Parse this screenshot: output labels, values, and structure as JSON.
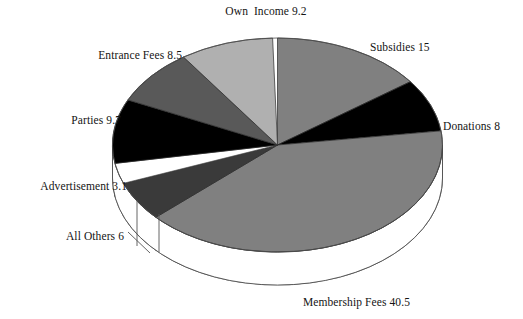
{
  "chart_data": {
    "type": "pie",
    "title": "",
    "subtitle": "",
    "xlabel": "",
    "ylabel": "",
    "legend_position": "none",
    "grid": false,
    "style": "3d-pie",
    "total": 100.5,
    "units": "percent",
    "categories": [
      "Subsidies",
      "Donations",
      "Membership Fees",
      "All Others",
      "Advertisement",
      "Parties",
      "Entrance Fees",
      "Own  Income"
    ],
    "values": [
      15,
      8,
      40.5,
      6,
      3.1,
      9.7,
      8.5,
      9.2
    ],
    "slices": [
      {
        "name": "Subsidies",
        "value": 15,
        "label": "Subsidies 15",
        "color": "#808080",
        "start_angle": 0,
        "end_angle": 53.7
      },
      {
        "name": "Donations",
        "value": 8,
        "label": "Donations 8",
        "color": "#000000",
        "start_angle": 53.7,
        "end_angle": 82.4
      },
      {
        "name": "Membership Fees",
        "value": 40.5,
        "label": "Membership Fees 40.5",
        "color": "#808080",
        "start_angle": 82.4,
        "end_angle": 227.5
      },
      {
        "name": "All Others",
        "value": 6,
        "label": "All Others 6",
        "color": "#3a3a3a",
        "start_angle": 227.5,
        "end_angle": 249.0
      },
      {
        "name": "Advertisement",
        "value": 3.1,
        "label": "Advertisement 3.1",
        "color": "#ffffff",
        "start_angle": 249.0,
        "end_angle": 260.1
      },
      {
        "name": "Parties",
        "value": 9.7,
        "label": "Parties 9.7",
        "color": "#000000",
        "start_angle": 260.1,
        "end_angle": 294.9
      },
      {
        "name": "Entrance Fees",
        "value": 8.5,
        "label": "Entrance Fees 8.5",
        "color": "#595959",
        "start_angle": 294.9,
        "end_angle": 325.3
      },
      {
        "name": "Own  Income",
        "value": 9.2,
        "label": "Own  Income 9.2",
        "color": "#b0b0b0",
        "start_angle": 325.3,
        "end_angle": 358.3
      }
    ]
  },
  "labels": {
    "own_income": "Own  Income 9.2",
    "subsidies": "Subsidies 15",
    "donations": "Donations 8",
    "membership_fees": "Membership Fees 40.5",
    "all_others": "All Others 6",
    "advertisement": "Advertisement 3.1",
    "parties": "Parties 9.7",
    "entrance_fees": "Entrance Fees 8.5"
  },
  "colors": {
    "background": "#ffffff",
    "text": "#141414",
    "outline": "#4d4d4d",
    "gray_mid": "#808080",
    "gray_light": "#b0b0b0",
    "gray_dark": "#595959",
    "gray_darker": "#3a3a3a",
    "black": "#000000",
    "white": "#ffffff"
  }
}
